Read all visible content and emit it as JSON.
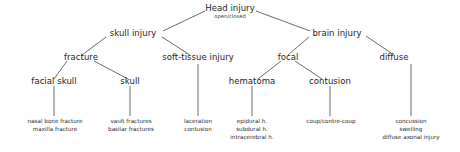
{
  "diagram": {
    "type": "hierarchy-tree",
    "line_color": "#555a5e",
    "text_color": "#1f2326",
    "background": "#ffffff",
    "nodes": {
      "root": {
        "label": "Head injury",
        "sub": "open/closed"
      },
      "skull_injury": {
        "label": "skull injury"
      },
      "brain_injury": {
        "label": "brain injury"
      },
      "fracture": {
        "label": "fracture"
      },
      "soft_tissue": {
        "label": "soft-tissue injury"
      },
      "focal": {
        "label": "focal"
      },
      "diffuse": {
        "label": "diffuse"
      },
      "facial_skull": {
        "label": "facial skull"
      },
      "skull": {
        "label": "skull"
      },
      "hematoma": {
        "label": "hematoma"
      },
      "contusion": {
        "label": "contusion"
      }
    },
    "leaves": {
      "facial_skull_items": {
        "line1": "nasal bone fracture",
        "line2": "maxilla fracture"
      },
      "skull_items": {
        "line1": "vault fractures",
        "line2": "basilar fractures"
      },
      "soft_tissue_items": {
        "line1": "laceration",
        "line2": "contusion"
      },
      "hematoma_items": {
        "line1": "epidural h.",
        "line2": "subdural h.",
        "line3": "intracerebral h."
      },
      "contusion_items": {
        "line1": "coup/contre-coup"
      },
      "diffuse_items": {
        "line1": "concussion",
        "line2": "swelling",
        "line3": "diffuse axonal injury"
      }
    }
  }
}
